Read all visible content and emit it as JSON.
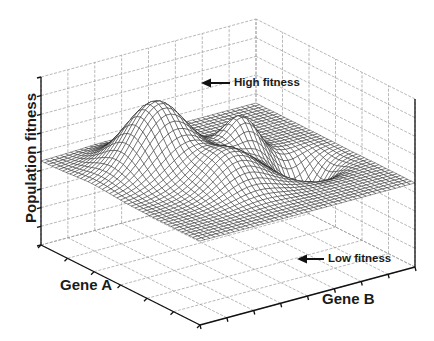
{
  "chart_data": {
    "type": "surface3d",
    "title": "",
    "xlabel": "Gene A",
    "ylabel": "Gene B",
    "zlabel": "Population fitness",
    "grid": true,
    "tick_labels": "none",
    "grid_divisions": {
      "x": 6,
      "y": 8,
      "z": 9
    },
    "z_baseline_fraction": 0.5,
    "surface": {
      "style": "wireframe mesh",
      "resolution": 44,
      "baseline": 0,
      "features": [
        {
          "name": "High fitness peak",
          "x": 0.3,
          "y": 0.32,
          "amplitude": 1.0,
          "spread": 0.12
        },
        {
          "name": "Secondary peak",
          "x": 0.62,
          "y": 0.42,
          "amplitude": 0.6,
          "spread": 0.07
        },
        {
          "name": "Broad hump",
          "x": 0.42,
          "y": 0.62,
          "amplitude": 0.52,
          "spread": 0.11
        },
        {
          "name": "Low fitness pit",
          "x": 0.78,
          "y": 0.6,
          "amplitude": -0.62,
          "spread": 0.07
        }
      ],
      "z_range": [
        -1,
        1
      ]
    },
    "annotations": [
      {
        "text": "High fitness",
        "points_to": "High fitness peak",
        "arrow": "left"
      },
      {
        "text": "Low fitness",
        "points_to": "Low fitness pit",
        "arrow": "left"
      }
    ],
    "view": {
      "origin_front_bottom": [
        200,
        325
      ],
      "x_axis_end_left_bottom": [
        41,
        245
      ],
      "y_axis_end_right_bottom": [
        415,
        267
      ],
      "z_height_px": 168
    }
  },
  "labels": {
    "zlabel": "Population fitness",
    "xlabel": "Gene A",
    "ylabel": "Gene B",
    "high": "High fitness",
    "low": "Low fitness"
  },
  "colors": {
    "mesh": "#1a1a1a",
    "mesh_fill": "#ffffff",
    "grid": "#9a9a9a",
    "axis": "#111111",
    "background": "#ffffff"
  }
}
